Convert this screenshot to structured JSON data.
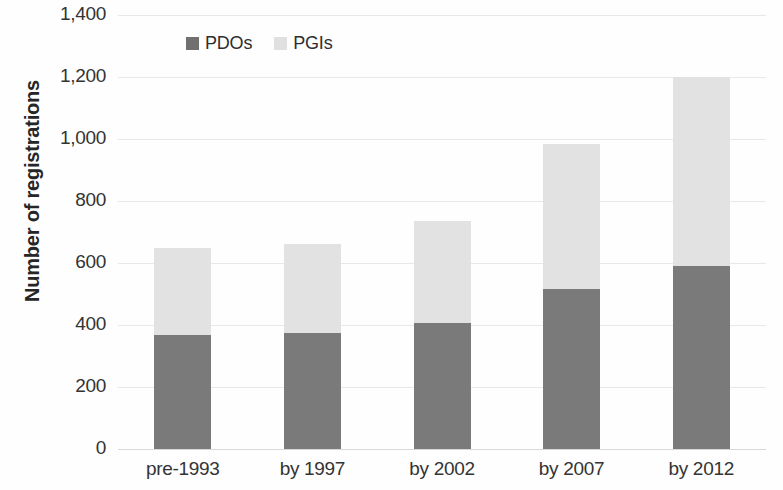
{
  "chart_data": {
    "type": "bar",
    "subtype": "stacked-column",
    "title": "",
    "xlabel": "",
    "ylabel": "Number of registrations",
    "categories": [
      "pre-1993",
      "by 1997",
      "by 2002",
      "by 2007",
      "by 2012"
    ],
    "series": [
      {
        "name": "PDOs",
        "color": "#7a7a7a",
        "values": [
          368,
          375,
          405,
          515,
          590
        ]
      },
      {
        "name": "PGIs",
        "color": "#e2e2e2",
        "values": [
          282,
          285,
          330,
          470,
          610
        ]
      }
    ],
    "totals": [
      650,
      660,
      735,
      985,
      1200
    ],
    "ylim": [
      0,
      1400
    ],
    "ytick_step": 200,
    "ytick_labels": [
      "1,400",
      "1,200",
      "1,000",
      "800",
      "600",
      "400",
      "200",
      "0"
    ],
    "ytick_values": [
      1400,
      1200,
      1000,
      800,
      600,
      400,
      200,
      0
    ],
    "grid": true,
    "legend_position": "top-left-inside"
  },
  "legend": {
    "items": [
      {
        "label": "PDOs",
        "swatch": "pdo"
      },
      {
        "label": "PGIs",
        "swatch": "pgi"
      }
    ]
  },
  "axes": {
    "y_title": "Number of registrations"
  }
}
